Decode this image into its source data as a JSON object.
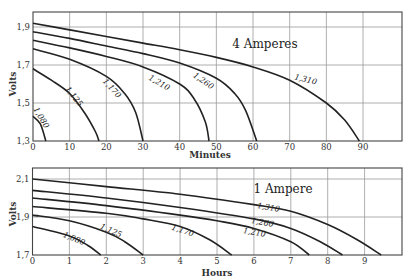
{
  "chart_data": [
    {
      "type": "line",
      "title": "4 Amperes",
      "xlabel": "Minutes",
      "ylabel": "Volts",
      "xlim": [
        0,
        100
      ],
      "ylim": [
        1.3,
        1.98
      ],
      "x_ticks": [
        "0",
        "10",
        "20",
        "30",
        "40",
        "50",
        "60",
        "70",
        "80",
        "90"
      ],
      "y_ticks": [
        "1,3",
        "1,5",
        "1,7",
        "1,9"
      ],
      "grid": true,
      "series": [
        {
          "name": "1,310",
          "points": [
            [
              0,
              1.92
            ],
            [
              10,
              1.885
            ],
            [
              20,
              1.85
            ],
            [
              30,
              1.815
            ],
            [
              40,
              1.78
            ],
            [
              50,
              1.74
            ],
            [
              60,
              1.69
            ],
            [
              70,
              1.62
            ],
            [
              80,
              1.5
            ],
            [
              85,
              1.41
            ],
            [
              89,
              1.3
            ]
          ],
          "label_at": [
            305,
            82,
            14
          ]
        },
        {
          "name": "1,260",
          "points": [
            [
              0,
              1.875
            ],
            [
              10,
              1.84
            ],
            [
              20,
              1.8
            ],
            [
              30,
              1.76
            ],
            [
              40,
              1.71
            ],
            [
              50,
              1.63
            ],
            [
              55,
              1.55
            ],
            [
              58,
              1.46
            ],
            [
              61,
              1.3
            ]
          ],
          "label_at": [
            202,
            83,
            35
          ]
        },
        {
          "name": "1,210",
          "points": [
            [
              0,
              1.83
            ],
            [
              10,
              1.79
            ],
            [
              20,
              1.745
            ],
            [
              30,
              1.69
            ],
            [
              40,
              1.6
            ],
            [
              44,
              1.52
            ],
            [
              47,
              1.4
            ],
            [
              48,
              1.3
            ]
          ],
          "label_at": [
            158,
            85,
            30
          ]
        },
        {
          "name": "1,170",
          "points": [
            [
              0,
              1.785
            ],
            [
              10,
              1.73
            ],
            [
              20,
              1.64
            ],
            [
              25,
              1.55
            ],
            [
              28,
              1.45
            ],
            [
              30,
              1.3
            ]
          ],
          "label_at": [
            110,
            90,
            48
          ]
        },
        {
          "name": "1,125",
          "points": [
            [
              0,
              1.68
            ],
            [
              5,
              1.62
            ],
            [
              10,
              1.55
            ],
            [
              14,
              1.45
            ],
            [
              17,
              1.35
            ],
            [
              18,
              1.3
            ]
          ],
          "label_at": [
            72,
            98,
            52
          ]
        },
        {
          "name": "1,080",
          "points": [
            [
              0,
              1.43
            ],
            [
              2,
              1.39
            ],
            [
              3.5,
              1.3
            ]
          ],
          "label_at": [
            39,
            119,
            60
          ]
        }
      ]
    },
    {
      "type": "line",
      "title": "1 Ampere",
      "xlabel": "Hours",
      "ylabel": "Volts",
      "xlim": [
        0,
        10.1
      ],
      "ylim": [
        1.7,
        2.16
      ],
      "x_ticks": [
        "0",
        "1",
        "2",
        "3",
        "4",
        "5",
        "6",
        "7",
        "8",
        "9"
      ],
      "y_ticks": [
        "1,7",
        "1,9",
        "2,1"
      ],
      "grid": true,
      "series": [
        {
          "name": "1,310",
          "points": [
            [
              0,
              2.1
            ],
            [
              2,
              2.06
            ],
            [
              4,
              2.02
            ],
            [
              6,
              1.965
            ],
            [
              7,
              1.93
            ],
            [
              8,
              1.86
            ],
            [
              8.8,
              1.78
            ],
            [
              9.45,
              1.7
            ]
          ],
          "label_at": [
            268,
            210,
            10
          ]
        },
        {
          "name": "1,260",
          "points": [
            [
              0,
              2.04
            ],
            [
              2,
              2.0
            ],
            [
              4,
              1.95
            ],
            [
              6,
              1.89
            ],
            [
              7,
              1.84
            ],
            [
              7.8,
              1.77
            ],
            [
              8.4,
              1.7
            ]
          ],
          "label_at": [
            262,
            225,
            10
          ]
        },
        {
          "name": "1,210",
          "points": [
            [
              0,
              2.0
            ],
            [
              2,
              1.96
            ],
            [
              4,
              1.91
            ],
            [
              5,
              1.88
            ],
            [
              6,
              1.84
            ],
            [
              7,
              1.77
            ],
            [
              7.5,
              1.7
            ]
          ],
          "label_at": [
            254,
            235,
            10
          ]
        },
        {
          "name": "1,170",
          "points": [
            [
              0,
              1.955
            ],
            [
              2,
              1.92
            ],
            [
              3,
              1.89
            ],
            [
              4,
              1.85
            ],
            [
              4.8,
              1.78
            ],
            [
              5.4,
              1.7
            ]
          ],
          "label_at": [
            182,
            233,
            18
          ]
        },
        {
          "name": "1,125",
          "points": [
            [
              0,
              1.91
            ],
            [
              1,
              1.88
            ],
            [
              2,
              1.82
            ],
            [
              2.5,
              1.77
            ],
            [
              3.0,
              1.7
            ]
          ],
          "label_at": [
            110,
            233,
            24
          ]
        },
        {
          "name": "1,080",
          "points": [
            [
              0,
              1.85
            ],
            [
              1,
              1.8
            ],
            [
              1.5,
              1.75
            ],
            [
              1.85,
              1.7
            ]
          ],
          "label_at": [
            73,
            241,
            22
          ]
        }
      ]
    }
  ],
  "charts": {
    "top": {
      "title": "4 Amperes",
      "xlabel": "Minutes",
      "ylabel": "Volts"
    },
    "bottom": {
      "title": "1 Ampere",
      "xlabel": "Hours",
      "ylabel": "Volts"
    }
  }
}
